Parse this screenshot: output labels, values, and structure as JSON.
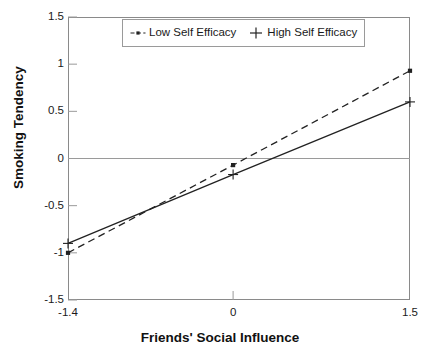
{
  "chart_data": {
    "type": "line",
    "title": "",
    "xlabel": "Friends' Social Influence",
    "ylabel": "Smoking Tendency",
    "xlim": [
      -1.4,
      1.5
    ],
    "ylim": [
      -1.5,
      1.5
    ],
    "xticks": [
      "-1.4",
      "0",
      "1.5"
    ],
    "xtick_values": [
      -1.4,
      0,
      1.5
    ],
    "yticks": [
      "1.5",
      "1",
      "0.5",
      "0",
      "-0.5",
      "-1",
      "-1.5"
    ],
    "ytick_values": [
      1.5,
      1,
      0.5,
      0,
      -0.5,
      -1,
      -1.5
    ],
    "grid": false,
    "zero_line": true,
    "legend_position": "top-center",
    "x": [
      -1.4,
      0,
      1.5
    ],
    "series": [
      {
        "name": "Low Self Efficacy",
        "values": [
          -1.0,
          -0.07,
          0.93
        ],
        "style": "dashed",
        "marker": "square-dot",
        "color": "#222222"
      },
      {
        "name": "High Self Efficacy",
        "values": [
          -0.9,
          -0.17,
          0.6
        ],
        "style": "solid",
        "marker": "plus",
        "color": "#222222"
      }
    ]
  },
  "legend": {
    "entries": [
      {
        "label": "Low Self Efficacy",
        "marker": "square-dot-dashed-icon"
      },
      {
        "label": "High Self Efficacy",
        "marker": "plus-icon"
      }
    ]
  },
  "colors": {
    "frame": "#8a8a8a",
    "zero_line": "#9a9a9a",
    "tick": "#9a9a9a",
    "line": "#222222",
    "text": "#1a1a1a",
    "background": "#ffffff"
  }
}
